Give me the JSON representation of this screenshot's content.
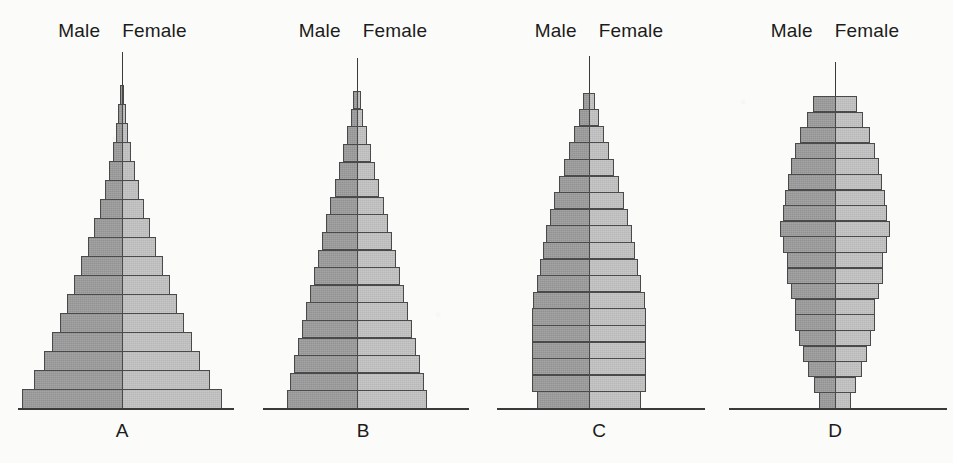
{
  "figure": {
    "background_color": "#fbfbfa",
    "male_color": "#9a9a9a",
    "female_color": "#bfbfbf",
    "outline_color": "#4a4a4a",
    "axis_color": "#3a3a3a",
    "male_label": "Male",
    "female_label": "Female"
  },
  "chart_data": {
    "type": "bar",
    "title": "",
    "subtitle": "",
    "xlabel": "",
    "ylabel": "",
    "grid": false,
    "legend_position": "top",
    "legend": [
      "Male",
      "Female"
    ],
    "layout": "four side-by-side back-to-back population pyramids labelled A, B, C, D",
    "orientation": "horizontal back-to-back (population pyramid)",
    "note": "Bar lengths are read off the drawing as relative half-widths in pixels; youngest age group at the bottom, oldest at the top.",
    "panels": [
      {
        "id": "A",
        "label": "A",
        "shape": "broad-based expansive pyramid with a very long narrow apex spike",
        "bar_count": 17,
        "series": [
          {
            "name": "Male",
            "side": "left"
          },
          {
            "name": "Female",
            "side": "right"
          }
        ],
        "half_widths_bottom_to_top": [
          100,
          88,
          78,
          70,
          62,
          55,
          48,
          41,
          34,
          28,
          22,
          17,
          13,
          9,
          6,
          4,
          2
        ],
        "axis_top_extension": true
      },
      {
        "id": "B",
        "label": "B",
        "shape": "narrower-based pyramid, steadily tapering, moderate apex spike",
        "bar_count": 18,
        "series": [
          {
            "name": "Male",
            "side": "left"
          },
          {
            "name": "Female",
            "side": "right"
          }
        ],
        "half_widths_bottom_to_top": [
          70,
          67,
          63,
          59,
          55,
          51,
          47,
          43,
          39,
          35,
          31,
          27,
          22,
          18,
          14,
          10,
          6,
          4
        ],
        "axis_top_extension": true
      },
      {
        "id": "C",
        "label": "C",
        "shape": "near-stationary column: almost vertical sides in lower half, tapering above",
        "bar_count": 19,
        "series": [
          {
            "name": "Male",
            "side": "left"
          },
          {
            "name": "Female",
            "side": "right"
          }
        ],
        "half_widths_bottom_to_top": [
          52,
          57,
          57,
          57,
          57,
          57,
          56,
          52,
          49,
          46,
          43,
          39,
          35,
          30,
          25,
          20,
          15,
          10,
          6
        ],
        "axis_top_extension": true
      },
      {
        "id": "D",
        "label": "D",
        "shape": "constrictive/urn shape: narrow base, bulge in the middle, blunt rounded top",
        "bar_count": 20,
        "series": [
          {
            "name": "Male",
            "side": "left"
          },
          {
            "name": "Female",
            "side": "right"
          }
        ],
        "half_widths_bottom_to_top": [
          16,
          21,
          27,
          32,
          36,
          40,
          40,
          44,
          48,
          48,
          52,
          55,
          52,
          50,
          47,
          44,
          40,
          35,
          28,
          22
        ],
        "axis_top_extension": true
      }
    ]
  },
  "panels_header": [
    {
      "male": "Male",
      "female": "Female"
    },
    {
      "male": "Male",
      "female": "Female"
    },
    {
      "male": "Male",
      "female": "Female"
    },
    {
      "male": "Male",
      "female": "Female"
    }
  ],
  "panel_letters": [
    "A",
    "B",
    "C",
    "D"
  ]
}
